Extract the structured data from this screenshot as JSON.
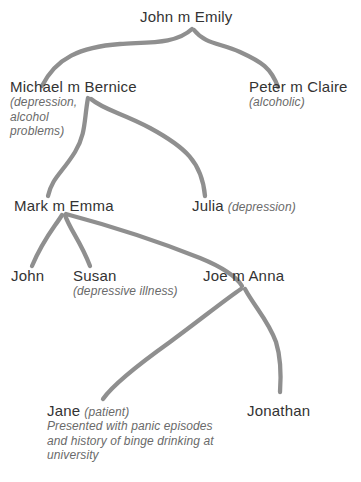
{
  "diagram": {
    "line_color": "#8f8f8f",
    "name_color": "#333333",
    "note_color": "#6a6a6a",
    "background": "#ffffff"
  },
  "people": {
    "john_emily": {
      "name": "John m Emily",
      "note": ""
    },
    "michael_bernice": {
      "name": "Michael m Bernice",
      "note": "(depression, alcohol problems)"
    },
    "peter_claire": {
      "name": "Peter m Claire",
      "note": "(alcoholic)"
    },
    "mark_emma": {
      "name": "Mark m Emma",
      "note": ""
    },
    "julia": {
      "name": "Julia",
      "note": "(depression)"
    },
    "john": {
      "name": "John",
      "note": ""
    },
    "susan": {
      "name": "Susan",
      "note": "(depressive illness)"
    },
    "joe_anna": {
      "name": "Joe m Anna",
      "note": ""
    },
    "jane": {
      "name": "Jane",
      "note": "(patient)",
      "description": "Presented with panic episodes and history of binge drinking at university"
    },
    "jonathan": {
      "name": "Jonathan",
      "note": ""
    }
  }
}
